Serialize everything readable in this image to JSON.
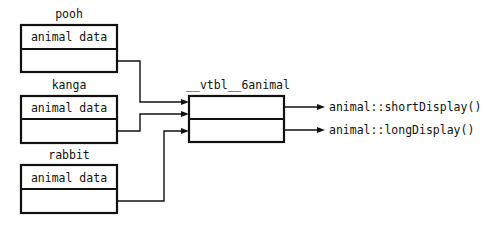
{
  "diagram": {
    "objects": [
      {
        "name": "pooh",
        "field": "animal data"
      },
      {
        "name": "kanga",
        "field": "animal data"
      },
      {
        "name": "rabbit",
        "field": "animal data"
      }
    ],
    "vtable": {
      "name": "__vtbl__6animal",
      "entries": [
        {
          "target": "animal::shortDisplay()"
        },
        {
          "target": "animal::longDisplay()"
        }
      ]
    },
    "connections": [
      {
        "from": "pooh.vptr",
        "to": "__vtbl__6animal"
      },
      {
        "from": "kanga.vptr",
        "to": "__vtbl__6animal"
      },
      {
        "from": "rabbit.vptr",
        "to": "__vtbl__6animal"
      },
      {
        "from": "__vtbl__6animal[0]",
        "to": "animal::shortDisplay()"
      },
      {
        "from": "__vtbl__6animal[1]",
        "to": "animal::longDisplay()"
      }
    ],
    "colors": {
      "ink": "#111111",
      "background": "#ffffff"
    }
  }
}
